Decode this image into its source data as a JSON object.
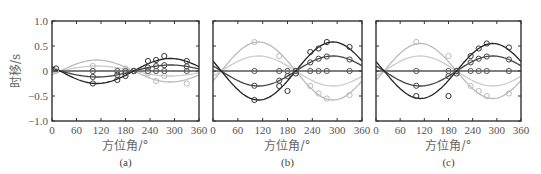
{
  "figure": {
    "ylabel": "时移/s",
    "xlabel": "方位角/°",
    "y_ticks": [
      "1.0",
      "0.5",
      "0",
      "−0.5",
      "−1.0"
    ],
    "x_ticks": [
      "0",
      "60",
      "120",
      "180",
      "240",
      "300",
      "360"
    ],
    "panel_labels": [
      "(a)",
      "(b)",
      "(c)"
    ]
  },
  "colors": {
    "dark": "#222222",
    "mid": "#555555",
    "light": "#bbbbbb",
    "lighter": "#cccccc",
    "axis": "#333333"
  },
  "chart_data": [
    {
      "type": "line",
      "panel": "(a)",
      "xlabel": "方位角/°",
      "ylabel": "时移/s",
      "xlim": [
        0,
        360
      ],
      "ylim": [
        -1.0,
        1.0
      ],
      "x_ticks": [
        0,
        60,
        120,
        180,
        240,
        300,
        360
      ],
      "y_ticks": [
        -1.0,
        -0.5,
        0,
        0.5,
        1.0
      ],
      "model": "y = A * sin(azimuth - 200°)",
      "series": [
        {
          "name": "dark-1",
          "color": "#222222",
          "amplitude": 0.25
        },
        {
          "name": "dark-2",
          "color": "#444444",
          "amplitude": 0.12
        },
        {
          "name": "flat",
          "color": "#555555",
          "amplitude": 0.0
        },
        {
          "name": "light-1",
          "color": "#bbbbbb",
          "amplitude": -0.22
        },
        {
          "name": "light-2",
          "color": "#cccccc",
          "amplitude": -0.1
        }
      ],
      "points": {
        "azimuths": [
          10,
          100,
          160,
          180,
          200,
          235,
          255,
          275,
          330
        ],
        "dark_values": [
          0.05,
          -0.25,
          -0.18,
          -0.1,
          0.0,
          0.2,
          0.22,
          0.3,
          0.2
        ],
        "light_values": [
          0.0,
          0.1,
          0.0,
          0.05,
          0.0,
          -0.05,
          -0.2,
          -0.1,
          -0.25
        ]
      }
    },
    {
      "type": "line",
      "panel": "(b)",
      "xlabel": "方位角/°",
      "xlim": [
        0,
        360
      ],
      "ylim": [
        -1.0,
        1.0
      ],
      "model": "y = A * sin(azimuth - 200°)",
      "series": [
        {
          "name": "dark-1",
          "color": "#222222",
          "amplitude": 0.58
        },
        {
          "name": "dark-2",
          "color": "#444444",
          "amplitude": 0.3
        },
        {
          "name": "flat",
          "color": "#555555",
          "amplitude": 0.0
        },
        {
          "name": "light-1",
          "color": "#bbbbbb",
          "amplitude": -0.58
        },
        {
          "name": "light-2",
          "color": "#cccccc",
          "amplitude": -0.3
        }
      ],
      "points": {
        "azimuths": [
          100,
          160,
          180,
          200,
          235,
          255,
          275,
          330
        ],
        "dark_values": [
          -0.58,
          -0.3,
          -0.4,
          -0.05,
          0.38,
          0.45,
          0.58,
          0.48
        ],
        "light_values": [
          0.58,
          0.3,
          0.0,
          0.0,
          -0.3,
          -0.45,
          -0.55,
          -0.48
        ]
      }
    },
    {
      "type": "line",
      "panel": "(c)",
      "xlabel": "方位角/°",
      "xlim": [
        0,
        360
      ],
      "ylim": [
        -1.0,
        1.0
      ],
      "model": "y = A * sin(azimuth - 200°)",
      "series": [
        {
          "name": "dark-1",
          "color": "#222222",
          "amplitude": 0.55
        },
        {
          "name": "dark-2",
          "color": "#444444",
          "amplitude": 0.3
        },
        {
          "name": "flat",
          "color": "#555555",
          "amplitude": 0.0
        },
        {
          "name": "light-1",
          "color": "#bbbbbb",
          "amplitude": -0.55
        },
        {
          "name": "light-2",
          "color": "#cccccc",
          "amplitude": -0.3
        }
      ],
      "points": {
        "azimuths": [
          100,
          180,
          200,
          235,
          255,
          275,
          330
        ],
        "dark_values": [
          -0.5,
          -0.5,
          -0.05,
          0.3,
          0.45,
          0.55,
          0.47
        ],
        "light_values": [
          0.58,
          0.3,
          0.0,
          -0.3,
          -0.4,
          -0.5,
          -0.45
        ]
      }
    }
  ]
}
